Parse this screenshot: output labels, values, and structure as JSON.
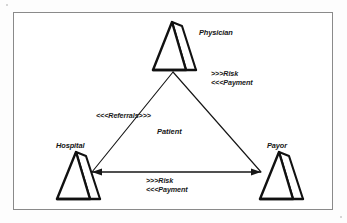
{
  "figure": {
    "background_color": "#ffffff",
    "frame_color": "#8a8a8a",
    "ink_color": "#111111",
    "nodes": [
      {
        "id": "physician",
        "label": "Physician",
        "position": "top"
      },
      {
        "id": "hospital",
        "label": "Hospital",
        "position": "bottom-left"
      },
      {
        "id": "payor",
        "label": "Payor",
        "position": "bottom-right"
      }
    ],
    "center": {
      "label": "Patient"
    },
    "edges": [
      {
        "id": "physician-payor",
        "from": "physician",
        "to": "payor",
        "lines": [
          ">>>Risk",
          "<<<Payment"
        ]
      },
      {
        "id": "hospital-physician",
        "from": "hospital",
        "to": "physician",
        "lines": [
          "<<<Referrals>>>"
        ]
      },
      {
        "id": "hospital-payor",
        "from": "hospital",
        "to": "payor",
        "lines": [
          ">>>Risk",
          "<<<Payment"
        ]
      }
    ]
  }
}
